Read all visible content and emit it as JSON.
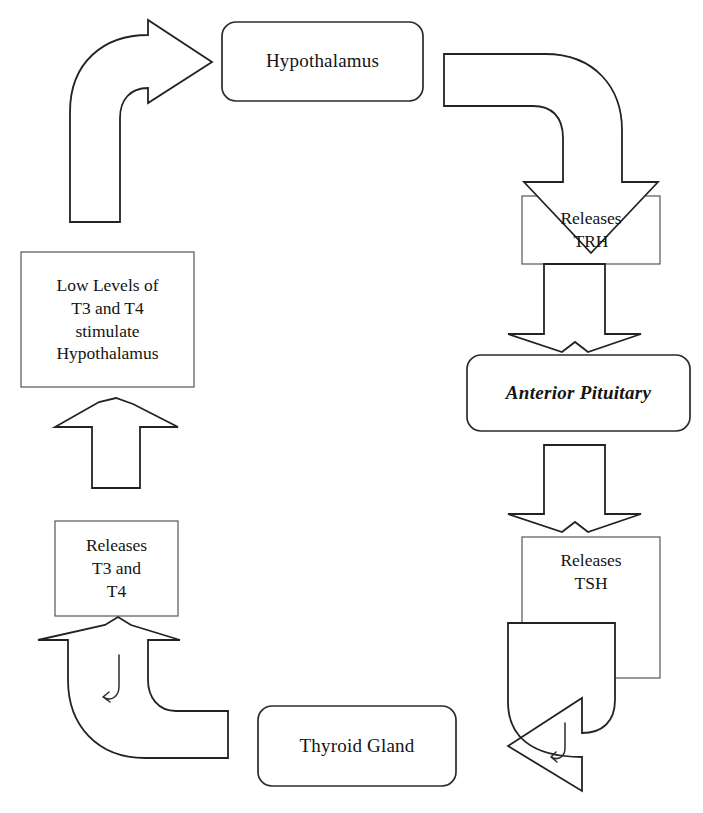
{
  "diagram": {
    "background_color": "#ffffff",
    "stroke_color": "#2b2b2b",
    "text_color": "#141414",
    "nodes": [
      {
        "id": "hypothalamus",
        "label": "Hypothalamus",
        "shape": "rounded-rectangle",
        "style": "regular",
        "x": 222,
        "y": 22,
        "w": 201,
        "h": 79
      },
      {
        "id": "releases-trh",
        "label": "Releases\nTRH",
        "shape": "rectangle",
        "style": "regular",
        "x": 522,
        "y": 196,
        "w": 138,
        "h": 68
      },
      {
        "id": "anterior-pituitary",
        "label": "Anterior Pituitary",
        "shape": "rounded-rectangle",
        "style": "italic",
        "x": 467,
        "y": 355,
        "w": 223,
        "h": 76
      },
      {
        "id": "releases-tsh",
        "label": "Releases\nTSH",
        "shape": "rectangle",
        "style": "regular",
        "x": 522,
        "y": 537,
        "w": 138,
        "h": 141
      },
      {
        "id": "thyroid-gland",
        "label": "Thyroid Gland",
        "shape": "rounded-rectangle",
        "style": "regular",
        "x": 258,
        "y": 706,
        "w": 198,
        "h": 80
      },
      {
        "id": "releases-t3-t4",
        "label": "Releases\nT3 and\nT4",
        "shape": "rectangle",
        "style": "regular",
        "x": 55,
        "y": 521,
        "w": 123,
        "h": 95
      },
      {
        "id": "low-levels",
        "label": "Low Levels of\nT3 and T4\nstimulate\nHypothalamus",
        "shape": "rectangle",
        "style": "regular",
        "x": 21,
        "y": 252,
        "w": 173,
        "h": 135
      }
    ],
    "arrows": [
      {
        "id": "arrow-lowlevels-to-hypothalamus",
        "from": "low-levels",
        "to": "hypothalamus",
        "kind": "curved-block-arrow",
        "direction": "up-then-right"
      },
      {
        "id": "arrow-hypothalamus-to-trh",
        "from": "hypothalamus",
        "to": "releases-trh",
        "kind": "curved-block-arrow",
        "direction": "right-then-down"
      },
      {
        "id": "arrow-trh-to-anterior",
        "from": "releases-trh",
        "to": "anterior-pituitary",
        "kind": "block-arrow",
        "direction": "down"
      },
      {
        "id": "arrow-anterior-to-tsh",
        "from": "anterior-pituitary",
        "to": "releases-tsh",
        "kind": "block-arrow",
        "direction": "down"
      },
      {
        "id": "arrow-tsh-to-thyroid",
        "from": "releases-tsh",
        "to": "thyroid-gland",
        "kind": "curved-block-arrow",
        "direction": "down-then-left"
      },
      {
        "id": "arrow-thyroid-to-t3t4",
        "from": "thyroid-gland",
        "to": "releases-t3-t4",
        "kind": "curved-block-arrow",
        "direction": "left-then-up"
      },
      {
        "id": "arrow-t3t4-to-lowlevels",
        "from": "releases-t3-t4",
        "to": "low-levels",
        "kind": "block-arrow",
        "direction": "up"
      }
    ]
  }
}
